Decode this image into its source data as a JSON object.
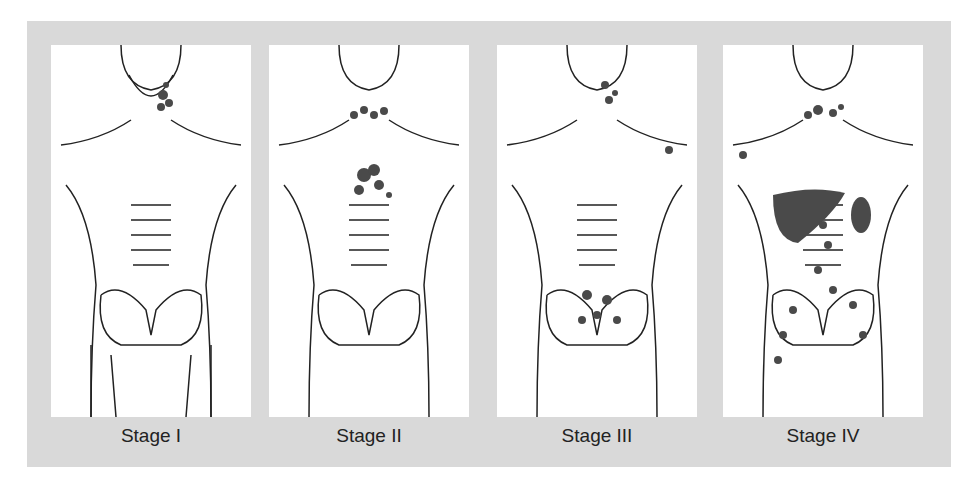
{
  "figure": {
    "stages": [
      {
        "label": "Stage I",
        "description": "Single lymph node region involved (neck)"
      },
      {
        "label": "Stage II",
        "description": "Two or more lymph node regions on same side of diaphragm (neck and chest)"
      },
      {
        "label": "Stage III",
        "description": "Lymph node regions on both sides of diaphragm (neck, axilla, abdomen)"
      },
      {
        "label": "Stage IV",
        "description": "Diffuse involvement including liver and spleen"
      }
    ],
    "colors": {
      "frame": "#d9d9d9",
      "panel": "#ffffff",
      "body_fill": "#f1f1f1",
      "node": "#4a4a4a",
      "outline": "#222222"
    }
  }
}
